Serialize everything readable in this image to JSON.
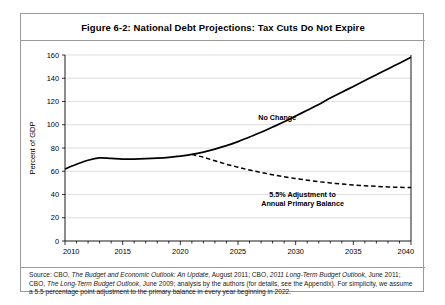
{
  "figure": {
    "title": "Figure 6-2: National Debt Projections: Tax Cuts Do Not Expire",
    "source_line_1_a": "Source: CBO, ",
    "source_line_1_b": "The Budget and Economic Outlook: An Update",
    "source_line_1_c": ", August 2011; CBO, ",
    "source_line_1_d": "2011 Long-Term Budget Outlook",
    "source_line_1_e": ",",
    "source_line_2_a": "June 2011; CBO, ",
    "source_line_2_b": "The Long-Term Budget Outlook",
    "source_line_2_c": ", June 2009; analysis by the authors (for details, see the Appendix).",
    "source_line_3": "For simplicity, we assume a 5.5 percentage point adjustment to the primary balance in every year beginning in 2022."
  },
  "chart_data": {
    "type": "line",
    "title": "Figure 6-2: National Debt Projections: Tax Cuts Do Not Expire",
    "xlabel": "",
    "ylabel": "Percent of GDP",
    "xlim": [
      2010,
      2040
    ],
    "ylim": [
      0,
      160
    ],
    "ytick_step": 20,
    "yticks": [
      0,
      20,
      40,
      60,
      80,
      100,
      120,
      140,
      160
    ],
    "xticks": [
      2010,
      2015,
      2020,
      2025,
      2030,
      2035,
      2040
    ],
    "xtick_minor_step": 1,
    "grid": "horizontal",
    "legend": "inline-annotations",
    "series": [
      {
        "name": "No Change",
        "style": "solid",
        "color": "#000000",
        "annotation": "No Change",
        "x": [
          2010,
          2011,
          2012,
          2013,
          2014,
          2015,
          2016,
          2017,
          2018,
          2019,
          2020,
          2021,
          2022,
          2023,
          2024,
          2025,
          2026,
          2027,
          2028,
          2029,
          2030,
          2031,
          2032,
          2033,
          2034,
          2035,
          2036,
          2037,
          2038,
          2039,
          2040
        ],
        "values": [
          62,
          66,
          69.5,
          71.5,
          71,
          70.5,
          70.5,
          70.8,
          71.3,
          72,
          73,
          74.5,
          76.5,
          79,
          82,
          85.5,
          89.5,
          93.5,
          98,
          102.5,
          107.5,
          112.5,
          117.5,
          123,
          128,
          133,
          138,
          143,
          148,
          153,
          158
        ]
      },
      {
        "name": "5.5% Adjustment to Annual Primary Balance",
        "style": "dashed",
        "color": "#000000",
        "annotation_line_1": "5.5% Adjustment to",
        "annotation_line_2": "Annual Primary Balance",
        "x": [
          2021,
          2022,
          2023,
          2024,
          2025,
          2026,
          2027,
          2028,
          2029,
          2030,
          2031,
          2032,
          2033,
          2034,
          2035,
          2036,
          2037,
          2038,
          2039,
          2040
        ],
        "values": [
          74.5,
          72,
          69,
          66,
          63.5,
          61,
          59,
          57,
          55.3,
          53.7,
          52.3,
          51,
          50,
          49,
          48.2,
          47.5,
          47,
          46.5,
          46.2,
          46
        ]
      }
    ]
  }
}
